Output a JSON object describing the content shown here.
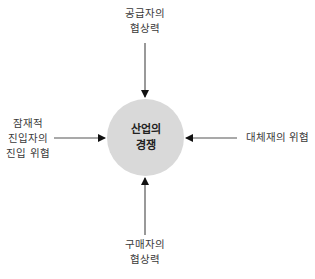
{
  "diagram": {
    "center": {
      "line1": "산업의",
      "line2": "경쟁",
      "fill": "#d9d9d9"
    },
    "forces": {
      "top": {
        "line1": "공급자의",
        "line2": "협상력"
      },
      "left": {
        "line1": "잠재적",
        "line2": "진입자의",
        "line3": "진입 위협"
      },
      "right": {
        "line1": "대체재의 위협"
      },
      "bottom": {
        "line1": "구매자의",
        "line2": "협상력"
      }
    },
    "arrow_color": "#555555"
  }
}
